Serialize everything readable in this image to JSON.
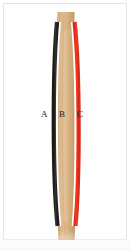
{
  "figure": {
    "caption": "",
    "background_color": "#ffffff",
    "frame_color": "#e3e3e3",
    "width": 130,
    "height": 251
  },
  "labels": [
    {
      "id": "A",
      "text": "A",
      "x": 43,
      "y": 114,
      "refers_to": "black-line-concave-side"
    },
    {
      "id": "B",
      "text": "B",
      "x": 62,
      "y": 114,
      "refers_to": "wooden-strip-center"
    },
    {
      "id": "C",
      "text": "C",
      "x": 80,
      "y": 114,
      "refers_to": "red-line-convex-side"
    }
  ],
  "elements": {
    "wood_strip": {
      "name": "wooden-strip",
      "color_light": "#e0bc90",
      "color_mid": "#cfa978",
      "color_dark": "#bd9463",
      "top_y": 12,
      "bottom_y": 240,
      "top_width": 22,
      "mid_width": 12
    },
    "black_line": {
      "name": "black-line",
      "color": "#2a2620",
      "top_y": 22,
      "bottom_y": 226,
      "stroke_width": 4.2,
      "side": "concave"
    },
    "red_line": {
      "name": "red-line",
      "color": "#ef3422",
      "top_y": 22,
      "bottom_y": 226,
      "stroke_width": 4.2,
      "side": "convex"
    },
    "white_gap": {
      "name": "white-separation-gap",
      "color": "#ffffff"
    }
  },
  "geometry": {
    "black_path": "M 57 22 C 52.5 70, 52.5 180, 58 226",
    "red_path": "M 74 22 C 80.5 70, 80.5 180, 75 226",
    "wood_left_path": "M 58 12 C 55 70, 55 180, 59 240",
    "wood_right_path": "M 73 12 C 77 70, 77 180, 74 240",
    "wood_top_cap": "M 58 12 L 73 12",
    "wood_bottom_cap": "M 59 240 L 74 240",
    "curvature_direction": "bowed-left-at-middle"
  },
  "colors": {
    "black": "#2a2620",
    "red": "#ef3422",
    "wood": "#cfa978",
    "wood_highlight": "#e2c096",
    "wood_shadow": "#b78b5c",
    "white": "#ffffff",
    "frame": "#e3e3e3",
    "label": "#1d1a16"
  }
}
